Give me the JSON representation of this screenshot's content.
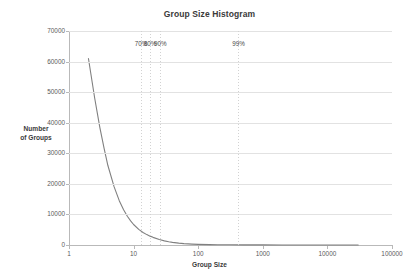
{
  "chart_data": {
    "type": "line",
    "title": "Group Size Histogram",
    "xlabel": "Group Size",
    "ylabel": "Number of Groups",
    "ylabel_lines": [
      "Number",
      "of Groups"
    ],
    "xscale": "log",
    "yscale": "linear",
    "xlim": [
      1,
      100000
    ],
    "ylim": [
      0,
      70000
    ],
    "grid": true,
    "legend": "none",
    "series_color": "#808080",
    "grid_color": "#e2e2e2",
    "axis_color": "#b9b9b9",
    "xticks": [
      1,
      10,
      100,
      1000,
      10000,
      100000
    ],
    "xtick_labels": [
      "1",
      "10",
      "100",
      "1000",
      "10000",
      "100000"
    ],
    "yticks": [
      0,
      10000,
      20000,
      30000,
      40000,
      50000,
      60000,
      70000
    ],
    "ytick_labels": [
      "0",
      "10000",
      "20000",
      "30000",
      "40000",
      "50000",
      "60000",
      "70000"
    ],
    "series": [
      {
        "name": "Group Size Histogram",
        "x": [
          2,
          2.5,
          3,
          3.5,
          4,
          5,
          6,
          7,
          8,
          9,
          10,
          12,
          14,
          16,
          18,
          20,
          25,
          30,
          35,
          40,
          50,
          60,
          70,
          80,
          100,
          150,
          200,
          300,
          500,
          1000,
          2000,
          5000,
          10000,
          20000,
          30000
        ],
        "y": [
          61000,
          48000,
          38500,
          31500,
          26000,
          19000,
          14500,
          11500,
          9400,
          7900,
          6700,
          5100,
          4100,
          3400,
          2900,
          2500,
          1800,
          1350,
          1050,
          850,
          600,
          450,
          360,
          300,
          220,
          130,
          95,
          65,
          45,
          30,
          22,
          15,
          12,
          10,
          9
        ]
      }
    ],
    "annotations": [
      {
        "label": "70%",
        "x": 13
      },
      {
        "label": "80%",
        "x": 18
      },
      {
        "label": "90%",
        "x": 26
      },
      {
        "label": "99%",
        "x": 420
      }
    ]
  }
}
